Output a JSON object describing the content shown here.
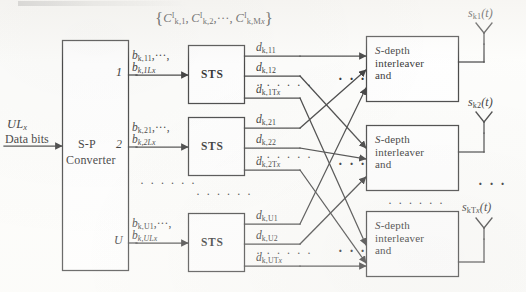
{
  "figure": {
    "type": "block-diagram",
    "title_fragment": "",
    "input": {
      "line1": "UL",
      "line1_sub": "x",
      "line2": "Data bits"
    },
    "converter": {
      "line1": "S-P",
      "line2": "Converter",
      "port_labels": [
        "1",
        "2",
        "U"
      ]
    },
    "code_set": {
      "open": "{",
      "c1": "C",
      "c1_sup": "I",
      "c1_sub": "k,1",
      "sep1": ",",
      "c2": "C",
      "c2_sup": "I",
      "c2_sub": "k,2",
      "ellipsis": ",···,",
      "c3": "C",
      "c3_sup": "I",
      "c3_sub": "k,M",
      "c3_sub2": "x",
      "close": "}"
    },
    "branches": [
      {
        "port": "1",
        "bits_line1": "b",
        "bits_line1_sub": "k,11",
        "bits_line1_tail": ",···,",
        "bits_line2": "b",
        "bits_line2_sub": "k,1Lx",
        "sts_label": "STS",
        "outputs": [
          {
            "sym": "d",
            "sub": "k,11"
          },
          {
            "sym": "d",
            "sub": "k,12"
          },
          {
            "sym": "d",
            "sub": "k,1T",
            "sub2": "x"
          }
        ],
        "vertical_dots": "· · · · · ·"
      },
      {
        "port": "2",
        "bits_line1": "b",
        "bits_line1_sub": "k,21",
        "bits_line1_tail": ",···,",
        "bits_line2": "b",
        "bits_line2_sub": "k,2Lx",
        "sts_label": "STS",
        "outputs": [
          {
            "sym": "d",
            "sub": "k,21"
          },
          {
            "sym": "d",
            "sub": "k,22"
          },
          {
            "sym": "d",
            "sub": "k,2T",
            "sub2": "x"
          }
        ],
        "vertical_dots": "· · · · · ·"
      },
      {
        "port": "U",
        "bits_line1": "b",
        "bits_line1_sub": "k,U1",
        "bits_line1_tail": ",···,",
        "bits_line2": "b",
        "bits_line2_sub": "k,ULx",
        "sts_label": "STS",
        "outputs": [
          {
            "sym": "d",
            "sub": "k,U1"
          },
          {
            "sym": "d",
            "sub": "k,U2"
          },
          {
            "sym": "d",
            "sub": "k,UT",
            "sub2": "x"
          }
        ],
        "vertical_dots": "· · · · · ·"
      }
    ],
    "interleavers": [
      {
        "line1_ital": "S",
        "line1_rest": "-depth",
        "line2": "interleaver",
        "line3": "and"
      },
      {
        "line1_ital": "S",
        "line1_rest": "-depth",
        "line2": "interleaver",
        "line3": "and"
      },
      {
        "line1_ital": "S",
        "line1_rest": "-depth",
        "line2": "interleaver",
        "line3": "and"
      }
    ],
    "antennas": [
      {
        "sym": "s",
        "sub": "k1",
        "arg": "(t)"
      },
      {
        "sym": "s",
        "sub": "k2",
        "arg": "(t)"
      },
      {
        "sym": "s",
        "sub": "kT",
        "sub2": "x",
        "arg": "(t)"
      }
    ],
    "row_ellipses": {
      "between_sts": "· · · · · ·",
      "between_converter_ports": "· · · · · ·",
      "between_interleavers": "· · · · · ·",
      "between_antennas": "· · ·",
      "crossbar": "· · ·"
    },
    "colors": {
      "line": "#2a2a2a",
      "text": "#131313",
      "paper": "#fdfdfb"
    }
  }
}
